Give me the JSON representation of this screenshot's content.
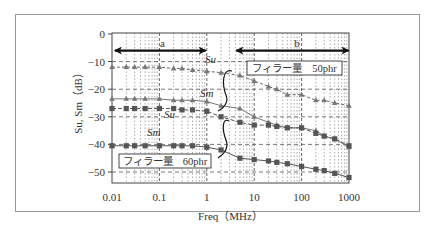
{
  "chart_data": {
    "type": "line",
    "title": "",
    "xlabel": "Freq（MHz）",
    "ylabel": "Su, Sm（dB）",
    "xscale": "log",
    "xlim": [
      0.01,
      1000
    ],
    "ylim": [
      -54,
      0
    ],
    "x_ticks": [
      "0.01",
      "0.1",
      "1",
      "10",
      "100",
      "1000"
    ],
    "y_ticks": [
      "0",
      "−10",
      "−20",
      "−30",
      "−40",
      "−50"
    ],
    "grid": true,
    "x": [
      0.01,
      0.02,
      0.03,
      0.05,
      0.1,
      0.2,
      0.3,
      0.5,
      1,
      2,
      5,
      10,
      20,
      30,
      50,
      100,
      200,
      300,
      500,
      1000
    ],
    "series": [
      {
        "name": "Su (フィラー量 50phr)",
        "marker": "triangle",
        "values": [
          -12,
          -12,
          -12,
          -12,
          -12,
          -12.5,
          -12.5,
          -13,
          -13.5,
          -14,
          -15,
          -17,
          -19,
          -20,
          -22,
          -22,
          -24,
          -24,
          -25,
          -26
        ]
      },
      {
        "name": "Sm (フィラー量 50phr)",
        "marker": "triangle",
        "values": [
          -23.5,
          -23.5,
          -23.5,
          -23.5,
          -23.5,
          -24,
          -24,
          -24,
          -24.5,
          -26,
          -27,
          -30,
          -32,
          -33,
          -34,
          -34,
          -35,
          -37,
          -38,
          -41
        ]
      },
      {
        "name": "Su (フィラー量 60phr)",
        "marker": "square",
        "values": [
          -27,
          -27,
          -27,
          -27,
          -27,
          -27,
          -27.5,
          -27.5,
          -28,
          -30,
          -32,
          -33,
          -33,
          -33.5,
          -34,
          -34,
          -36,
          -37,
          -38,
          -40.5
        ]
      },
      {
        "name": "Sm (フィラー量 60phr)",
        "marker": "square",
        "values": [
          -40.5,
          -40.5,
          -40.5,
          -40.5,
          -40.5,
          -40.5,
          -40.5,
          -40.5,
          -41,
          -42,
          -45,
          -45.5,
          -46,
          -46.5,
          -47,
          -48,
          -49,
          -49.5,
          -50.5,
          -52
        ]
      }
    ],
    "annotations": [
      {
        "text": "a",
        "type": "range-arrow",
        "from": 0.012,
        "to": 1.0,
        "y": -6
      },
      {
        "text": "b",
        "type": "range-arrow",
        "from": 4,
        "to": 1000,
        "y": -6
      },
      {
        "text": "フィラー量　50phr",
        "type": "box-label"
      },
      {
        "text": "フィラー量　60phr",
        "type": "box-label"
      },
      {
        "text": "Su",
        "type": "curve-label"
      },
      {
        "text": "Sm",
        "type": "curve-label"
      },
      {
        "text": "Su",
        "type": "curve-label"
      },
      {
        "text": "Sm",
        "type": "curve-label"
      }
    ]
  },
  "labels": {
    "xlabel": "Freq（MHz）",
    "ylabel": "Su, Sm（dB）",
    "range_a": "a",
    "range_b": "b",
    "box_50": "フィラー量　50phr",
    "box_60": "フィラー量　60phr",
    "su": "Su",
    "sm": "Sm"
  }
}
